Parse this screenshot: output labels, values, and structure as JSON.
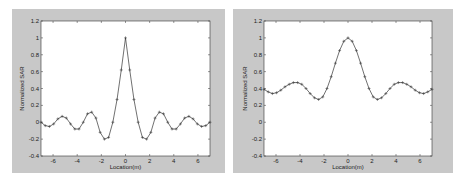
{
  "chart_data": [
    {
      "type": "line",
      "title": "",
      "xlabel": "Location(m)",
      "ylabel": "Normalized SAR",
      "xlim": [
        -7,
        7
      ],
      "ylim": [
        -0.4,
        1.2
      ],
      "xticks": [
        -6,
        -4,
        -2,
        0,
        2,
        4,
        6
      ],
      "yticks": [
        -0.4,
        -0.2,
        0,
        0.2,
        0.4,
        0.6,
        0.8,
        1,
        1.2
      ],
      "xtick_labels": [
        "-6",
        "-4",
        "-2",
        "0",
        "2",
        "4",
        "6"
      ],
      "ytick_labels": [
        "-0.4",
        "-0.2",
        "0",
        "0.2",
        "0.4",
        "0.6",
        "0.8",
        "1",
        "1.2"
      ],
      "grid": false,
      "legend": null,
      "marker": "+",
      "series": [
        {
          "name": "SAR profile",
          "x": [
            -7,
            -6.65,
            -6.3,
            -5.95,
            -5.6,
            -5.25,
            -4.9,
            -4.55,
            -4.2,
            -3.85,
            -3.5,
            -3.15,
            -2.8,
            -2.45,
            -2.1,
            -1.75,
            -1.4,
            -1.05,
            -0.7,
            -0.35,
            0,
            0.35,
            0.7,
            1.05,
            1.4,
            1.75,
            2.1,
            2.45,
            2.8,
            3.15,
            3.5,
            3.85,
            4.2,
            4.55,
            4.9,
            5.25,
            5.6,
            5.95,
            6.3,
            6.65,
            7
          ],
          "y": [
            0.0,
            -0.04,
            -0.05,
            -0.02,
            0.04,
            0.07,
            0.05,
            -0.02,
            -0.08,
            -0.08,
            0.0,
            0.1,
            0.12,
            0.05,
            -0.12,
            -0.2,
            -0.18,
            0.0,
            0.27,
            0.62,
            1.0,
            0.62,
            0.27,
            0.0,
            -0.18,
            -0.2,
            -0.12,
            0.05,
            0.12,
            0.1,
            0.0,
            -0.08,
            -0.08,
            -0.02,
            0.05,
            0.07,
            0.04,
            -0.02,
            -0.05,
            -0.04,
            0.0
          ]
        }
      ]
    },
    {
      "type": "line",
      "title": "",
      "xlabel": "Location(m)",
      "ylabel": "Normalized SAR",
      "xlim": [
        -7,
        7
      ],
      "ylim": [
        -0.4,
        1.2
      ],
      "xticks": [
        -6,
        -4,
        -2,
        0,
        2,
        4,
        6
      ],
      "yticks": [
        -0.4,
        -0.2,
        0,
        0.2,
        0.4,
        0.6,
        0.8,
        1,
        1.2
      ],
      "xtick_labels": [
        "-6",
        "-4",
        "-2",
        "0",
        "2",
        "4",
        "6"
      ],
      "ytick_labels": [
        "-0.4",
        "-0.2",
        "0",
        "0.2",
        "0.4",
        "0.6",
        "0.8",
        "1",
        "1.2"
      ],
      "grid": false,
      "legend": null,
      "marker": "+",
      "series": [
        {
          "name": "SAR profile",
          "x": [
            -7,
            -6.65,
            -6.3,
            -5.95,
            -5.6,
            -5.25,
            -4.9,
            -4.55,
            -4.2,
            -3.85,
            -3.5,
            -3.15,
            -2.8,
            -2.45,
            -2.1,
            -1.75,
            -1.4,
            -1.05,
            -0.7,
            -0.35,
            0,
            0.35,
            0.7,
            1.05,
            1.4,
            1.75,
            2.1,
            2.45,
            2.8,
            3.15,
            3.5,
            3.85,
            4.2,
            4.55,
            4.9,
            5.25,
            5.6,
            5.95,
            6.3,
            6.65,
            7
          ],
          "y": [
            0.39,
            0.36,
            0.34,
            0.35,
            0.38,
            0.42,
            0.45,
            0.47,
            0.47,
            0.45,
            0.4,
            0.34,
            0.29,
            0.27,
            0.3,
            0.4,
            0.54,
            0.7,
            0.85,
            0.96,
            1.0,
            0.96,
            0.85,
            0.7,
            0.54,
            0.4,
            0.3,
            0.27,
            0.29,
            0.34,
            0.4,
            0.45,
            0.47,
            0.47,
            0.45,
            0.42,
            0.38,
            0.35,
            0.34,
            0.36,
            0.39
          ]
        }
      ]
    }
  ],
  "layout": {
    "panels": [
      {
        "frame": [
          12,
          9,
          213,
          164
        ],
        "plot": [
          41,
          21,
          169,
          135
        ]
      },
      {
        "frame": [
          233,
          9,
          220,
          164
        ],
        "plot": [
          264,
          21,
          168,
          135
        ]
      }
    ],
    "colors": {
      "frame_bg": "#c8c8c8",
      "plot_bg": "#ffffff",
      "line": "#333333",
      "axis": "#333333"
    }
  }
}
